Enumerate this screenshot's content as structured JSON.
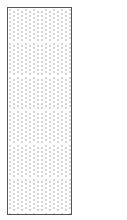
{
  "figure": {
    "shape": "rectangle",
    "fill_pattern": "dotted-herringbone",
    "border_color": "#555555",
    "dot_color": "#8a8a8a",
    "background_color": "#ffffff",
    "dot_spacing_px": 4,
    "zigzag_period_px": 34
  }
}
